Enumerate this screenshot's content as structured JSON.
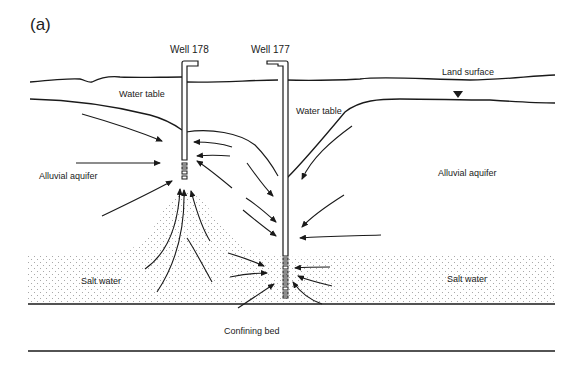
{
  "figure": {
    "panel_label": "(a)",
    "wells": [
      {
        "id": "well-178",
        "label": "Well 178"
      },
      {
        "id": "well-177",
        "label": "Well 177"
      }
    ],
    "labels": {
      "land_surface": "Land surface",
      "water_table_left": "Water table",
      "water_table_right": "Water table",
      "alluvial_aquifer_left": "Alluvial aquifer",
      "alluvial_aquifer_right": "Alluvial aquifer",
      "salt_water_left": "Salt water",
      "salt_water_right": "Salt water",
      "confining_bed": "Confining bed"
    },
    "symbols": {
      "water_table_marker": "inverted-triangle"
    },
    "colors": {
      "ink": "#1a1a1a",
      "background": "#ffffff",
      "stipple": "#9a9a9a"
    }
  }
}
